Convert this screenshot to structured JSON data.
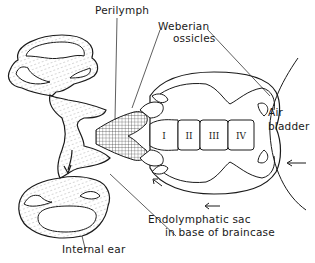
{
  "figure": {
    "labels": {
      "perilymph": "Perilymph",
      "weberian_line1": "Weberian",
      "weberian_line2": "ossicles",
      "air_line1": "Air",
      "air_line2": "bladder",
      "endo_line1": "Endolymphatic sac",
      "endo_line2": "in base of braincase",
      "internal_ear": "Internal ear"
    },
    "vertebrae": [
      "I",
      "II",
      "III",
      "IV"
    ],
    "colors": {
      "ink": "#1a1a1a",
      "background": "#ffffff"
    }
  }
}
